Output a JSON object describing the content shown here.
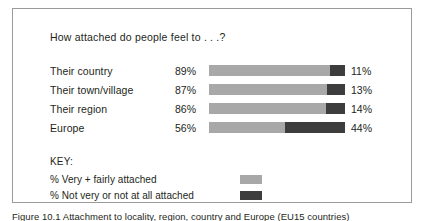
{
  "figure": {
    "title": "How attached do people feel to . . .?",
    "caption": "Figure 10.1 Attachment to locality, region, country and Europe (EU15 countries)"
  },
  "key": {
    "heading": "KEY:",
    "items": [
      {
        "label": "% Very + fairly attached",
        "color": "#a8a8a8"
      },
      {
        "label": "% Not very or not at all attached",
        "color": "#3d3d3d"
      }
    ]
  },
  "rows": [
    {
      "label": "Their country",
      "left_value": "89%",
      "right_value": "11%",
      "attached": 89,
      "not_attached": 11
    },
    {
      "label": "Their town/village",
      "left_value": "87%",
      "right_value": "13%",
      "attached": 87,
      "not_attached": 13
    },
    {
      "label": "Their region",
      "left_value": "86%",
      "right_value": "14%",
      "attached": 86,
      "not_attached": 14
    },
    {
      "label": "Europe",
      "left_value": "56%",
      "right_value": "44%",
      "attached": 56,
      "not_attached": 44
    }
  ],
  "chart_data": {
    "type": "bar",
    "title": "How attached do people feel to . . .?",
    "subtitle": "",
    "orientation": "horizontal",
    "stacked": true,
    "normalized_percent": true,
    "categories": [
      "Their country",
      "Their town/village",
      "Their region",
      "Europe"
    ],
    "series": [
      {
        "name": "% Very + fairly attached",
        "values": [
          89,
          87,
          86,
          56
        ],
        "color": "#a8a8a8"
      },
      {
        "name": "% Not very or not at all attached",
        "values": [
          11,
          13,
          14,
          44
        ],
        "color": "#3d3d3d"
      }
    ],
    "data_labels": {
      "left": [
        "89%",
        "87%",
        "86%",
        "56%"
      ],
      "right": [
        "11%",
        "13%",
        "14%",
        "44%"
      ]
    },
    "xlabel": "",
    "ylabel": "",
    "xlim": [
      0,
      100
    ],
    "grid": false,
    "axis_visible": false,
    "legend_position": "bottom-left",
    "legend_title": "KEY:"
  }
}
